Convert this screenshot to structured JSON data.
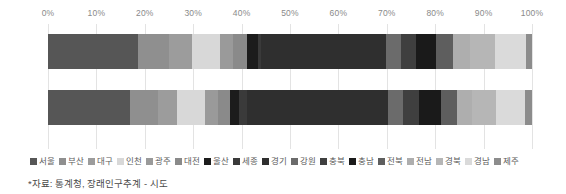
{
  "chart_data": {
    "type": "bar",
    "orientation": "horizontal",
    "stacked": true,
    "normalized": "100%",
    "title": "",
    "xlabel": "",
    "ylabel": "",
    "xlim": [
      0,
      100
    ],
    "grid": true,
    "legend_position": "bottom",
    "xticks": [
      "0%",
      "10%",
      "20%",
      "30%",
      "40%",
      "50%",
      "60%",
      "70%",
      "80%",
      "90%",
      "100%"
    ],
    "xtick_values": [
      0,
      10,
      20,
      30,
      40,
      50,
      60,
      70,
      80,
      90,
      100
    ],
    "categories": [
      "2020",
      "2050"
    ],
    "series": [
      {
        "name": "서울",
        "color": "#565656",
        "values": [
          18.6,
          16.5
        ]
      },
      {
        "name": "부산",
        "color": "#8f8f8f",
        "values": [
          6.5,
          5.6
        ]
      },
      {
        "name": "대구",
        "color": "#9c9c9c",
        "values": [
          4.7,
          4.0
        ]
      },
      {
        "name": "인천",
        "color": "#d8d8d8",
        "values": [
          5.7,
          5.6
        ]
      },
      {
        "name": "광주",
        "color": "#9a9a9a",
        "values": [
          2.8,
          2.5
        ]
      },
      {
        "name": "대전",
        "color": "#8a8a8a",
        "values": [
          2.8,
          2.5
        ]
      },
      {
        "name": "울산",
        "color": "#1c1c1c",
        "values": [
          2.2,
          1.8
        ]
      },
      {
        "name": "세종",
        "color": "#3a3a3a",
        "values": [
          0.7,
          1.6
        ]
      },
      {
        "name": "경기",
        "color": "#2f2f2f",
        "values": [
          25.9,
          28.4
        ]
      },
      {
        "name": "강원",
        "color": "#6b6b6b",
        "values": [
          3.0,
          3.1
        ]
      },
      {
        "name": "충북",
        "color": "#3f3f3f",
        "values": [
          3.1,
          3.2
        ]
      },
      {
        "name": "충남",
        "color": "#1a1a1a",
        "values": [
          4.1,
          4.5
        ]
      },
      {
        "name": "전북",
        "color": "#5e5e5e",
        "values": [
          3.5,
          3.1
        ]
      },
      {
        "name": "전남",
        "color": "#aeaeae",
        "values": [
          3.6,
          3.2
        ]
      },
      {
        "name": "경북",
        "color": "#b6b6b6",
        "values": [
          5.1,
          4.7
        ]
      },
      {
        "name": "경남",
        "color": "#dadada",
        "values": [
          6.4,
          5.9
        ]
      },
      {
        "name": "제주",
        "color": "#8c8c8c",
        "values": [
          1.3,
          1.4
        ]
      }
    ]
  },
  "footnote": "*자료: 통계청, 장래인구추계 - 시도"
}
